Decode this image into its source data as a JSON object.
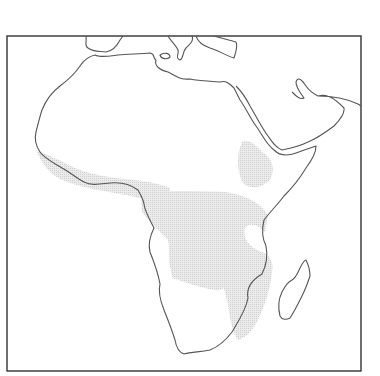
{
  "map": {
    "subject": "Africa",
    "shaded_region_description": "Stippled distribution range across West African coast, Central Africa, East Africa highlands (Ethiopia), and south-eastern Africa",
    "colors": {
      "frame": "#333333",
      "coastline": "#555555",
      "shading": "#d8d8d8",
      "background": "#ffffff"
    },
    "features": [
      {
        "name": "africa-mainland"
      },
      {
        "name": "madagascar"
      },
      {
        "name": "arabian-peninsula"
      },
      {
        "name": "southern-europe-coast"
      },
      {
        "name": "shaded-range"
      }
    ]
  }
}
